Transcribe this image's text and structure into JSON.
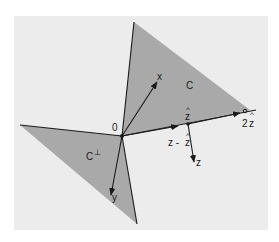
{
  "diagram": {
    "type": "cone-projection",
    "colors": {
      "frame_bg": "#ececec",
      "cone_fill": "#a9a9a9",
      "line": "#1a1a1a"
    },
    "labels": {
      "origin": "0",
      "cone": "C",
      "polar_cone": "C",
      "polar_superscript": "⊥",
      "x_vector": "x",
      "y_vector": "y",
      "z_vector": "z",
      "z_hat": "z",
      "z_hat_accent": "^",
      "two_z_hat_coef": "2",
      "two_z_hat": "z",
      "z_minus_z_hat": "z - ",
      "z_minus_z_hat_tail": "z"
    },
    "points": {
      "origin": [
        122,
        136
      ],
      "cone_top": [
        134,
        22
      ],
      "cone_right": [
        250,
        110
      ],
      "ray_end": [
        256,
        110
      ],
      "polar_left": [
        20,
        125
      ],
      "polar_bottom": [
        137,
        224
      ],
      "x_tip": [
        157,
        82
      ],
      "y_tip": [
        111,
        195
      ],
      "z_hat_pt": [
        188,
        124
      ],
      "two_z_hat_pt": [
        245,
        111
      ],
      "z_tip": [
        194,
        162
      ]
    }
  }
}
